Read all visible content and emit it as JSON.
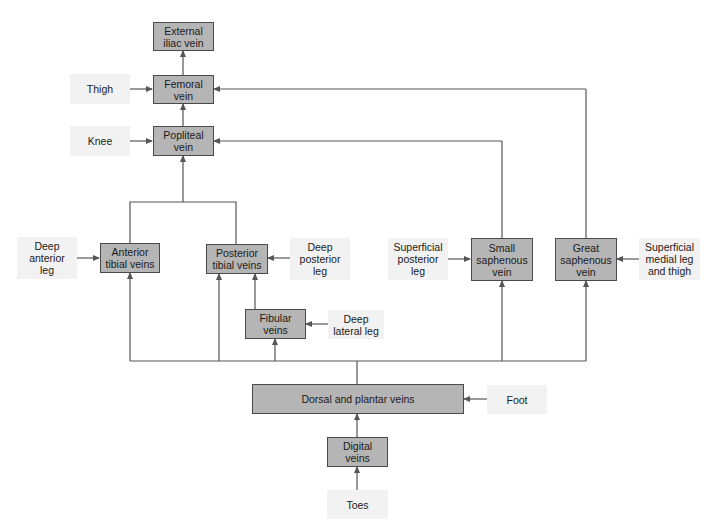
{
  "diagram": {
    "type": "flowchart",
    "veins": {
      "external_iliac": "External\niliac vein",
      "femoral": "Femoral\nvein",
      "popliteal": "Popliteal\nvein",
      "anterior_tibial": "Anterior\ntibial veins",
      "posterior_tibial": "Posterior\ntibial veins",
      "fibular": "Fibular\nveins",
      "small_saphenous": "Small\nsaphenous\nvein",
      "great_saphenous": "Great\nsaphenous\nvein",
      "dorsal_plantar": "Dorsal and plantar veins",
      "digital": "Digital\nveins"
    },
    "regions": {
      "thigh": "Thigh",
      "knee": "Knee",
      "deep_anterior_leg": "Deep\nanterior\nleg",
      "deep_posterior_leg": "Deep\nposterior\nleg",
      "deep_lateral_leg": "Deep\nlateral leg",
      "superficial_posterior_leg": "Superficial\nposterior\nleg",
      "superficial_medial_leg_thigh": "Superficial\nmedial leg\nand thigh",
      "foot": "Foot",
      "toes": "Toes"
    },
    "colors": {
      "vein_fill": "#b5b5b5",
      "vein_border": "#4a4a4a",
      "region_fill": "#f2f2f2",
      "connector": "#555555"
    }
  }
}
